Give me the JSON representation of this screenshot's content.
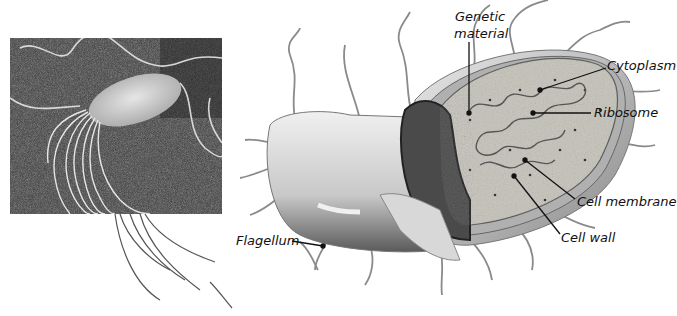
{
  "figure": {
    "photo": {
      "subject": "electron-micrograph-bacterium-with-flagella"
    },
    "diagram": {
      "subject": "bacterial-cell-cutaway",
      "labels": {
        "genetic_material_line1": "Genetic",
        "genetic_material_line2": "material",
        "cytoplasm": "Cytoplasm",
        "ribosome": "Ribosome",
        "cell_membrane": "Cell membrane",
        "cell_wall": "Cell wall",
        "flagellum": "Flagellum"
      }
    },
    "colors": {
      "photo_background": "#3a3a3a",
      "cell_body": "#d8d8d8",
      "cell_wall": "#9a9a9a",
      "cytoplasm": "#b8b8b0",
      "label_text": "#111111"
    }
  }
}
